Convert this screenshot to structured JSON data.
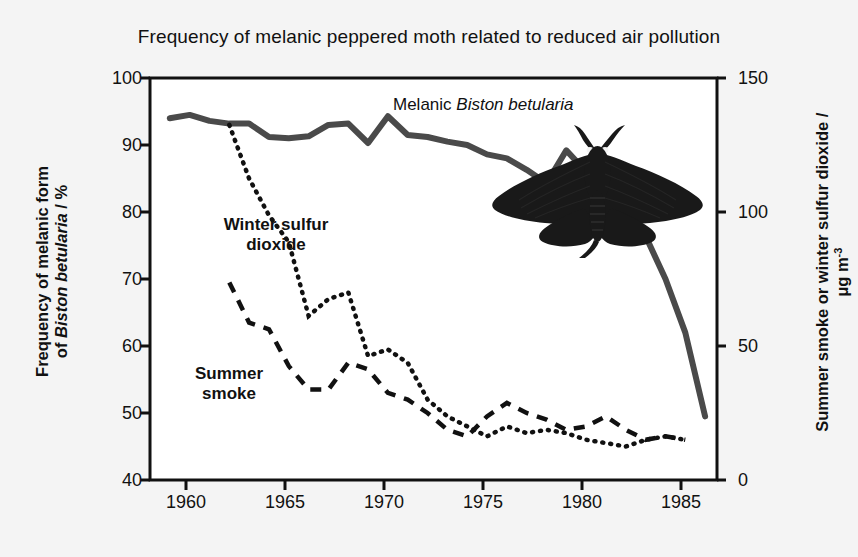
{
  "figure": {
    "title": "Frequency of melanic peppered moth related to reduced air pollution",
    "background_color": "#f4f4f4",
    "plot_background_color": "#ffffff",
    "axis_color": "#111111"
  },
  "annotations": {
    "melanic_label_prefix": "Melanic ",
    "melanic_label_species": "Biston betularia",
    "winter_so2_line1": "Winter sulfur",
    "winter_so2_line2": "dioxide",
    "summer_smoke_line1": "Summer",
    "summer_smoke_line2": "smoke",
    "moth_image_alt": "melanic-peppered-moth-photograph"
  },
  "axes": {
    "left": {
      "label_line1": "Frequency of melanic form",
      "label_line2_prefix": "of ",
      "label_line2_species": "Biston betularia",
      "label_line2_suffix": " / %",
      "ticks": [
        "40",
        "50",
        "60",
        "70",
        "80",
        "90",
        "100"
      ],
      "min": 40,
      "max": 100
    },
    "right": {
      "label_prefix": "Summer smoke or winter sulfur dioxide / ",
      "label_unit_base": "μg m",
      "label_unit_exp": "-3",
      "ticks": [
        "0",
        "50",
        "100",
        "150"
      ],
      "min": 0,
      "max": 150
    },
    "x": {
      "ticks": [
        "1960",
        "1965",
        "1970",
        "1975",
        "1980",
        "1985"
      ],
      "min": 1958,
      "max": 1986.6
    }
  },
  "chart_data": {
    "type": "line",
    "title": "Frequency of melanic peppered moth related to reduced air pollution",
    "xlabel": "",
    "ylabel": "Frequency of melanic form of Biston betularia / %",
    "ylabel_right": "Summer smoke or winter sulfur dioxide / μg m-3",
    "xlim": [
      1958,
      1986.6
    ],
    "ylim": [
      40,
      100
    ],
    "ylim_right": [
      0,
      150
    ],
    "grid": false,
    "legend": "annotations-inline",
    "series": [
      {
        "name": "Melanic Biston betularia",
        "axis": "left",
        "style": "solid",
        "color": "#4a4a4a",
        "width": 6,
        "x": [
          1959,
          1960,
          1961,
          1962,
          1963,
          1964,
          1965,
          1966,
          1967,
          1968,
          1969,
          1970,
          1971,
          1972,
          1973,
          1974,
          1975,
          1976,
          1977,
          1978,
          1979,
          1980,
          1981,
          1982,
          1983,
          1984,
          1985,
          1986
        ],
        "y": [
          94.0,
          94.5,
          93.6,
          93.2,
          93.2,
          91.2,
          91.0,
          91.3,
          93.0,
          93.2,
          90.3,
          94.3,
          91.5,
          91.2,
          90.5,
          90.0,
          88.6,
          88.0,
          86.3,
          84.3,
          89.2,
          86.0,
          80.0,
          76.8,
          76.4,
          70.0,
          62.0,
          49.5
        ]
      },
      {
        "name": "Winter sulfur dioxide",
        "axis": "right",
        "style": "dotted",
        "color": "#111111",
        "width": 4,
        "x": [
          1962,
          1963,
          1964,
          1965,
          1966,
          1967,
          1968,
          1969,
          1970,
          1971,
          1972,
          1973,
          1974,
          1975,
          1976,
          1977,
          1978,
          1979,
          1980,
          1981,
          1982,
          1983,
          1984,
          1985
        ],
        "y_left_equiv": [
          93.0,
          85.0,
          79.5,
          75.5,
          64.5,
          67.0,
          68.0,
          58.5,
          59.5,
          57.5,
          52.0,
          49.5,
          48.0,
          46.5,
          48.0,
          47.0,
          47.5,
          47.0,
          46.0,
          45.5,
          45.0,
          46.0,
          46.5,
          46.0
        ],
        "y": [
          132.5,
          112.5,
          98.8,
          88.8,
          61.3,
          67.5,
          70.0,
          46.3,
          48.8,
          43.8,
          30.0,
          23.8,
          20.0,
          16.3,
          20.0,
          17.5,
          18.8,
          17.5,
          15.0,
          13.8,
          12.5,
          15.0,
          16.3,
          15.0
        ]
      },
      {
        "name": "Summer smoke",
        "axis": "right",
        "style": "dashed",
        "color": "#111111",
        "width": 4,
        "x": [
          1962,
          1963,
          1964,
          1965,
          1966,
          1967,
          1968,
          1969,
          1970,
          1971,
          1972,
          1973,
          1974,
          1975,
          1976,
          1977,
          1978,
          1979,
          1980,
          1981,
          1982,
          1983,
          1984,
          1985
        ],
        "y_left_equiv": [
          69.5,
          63.5,
          62.5,
          57.0,
          53.5,
          53.5,
          57.5,
          56.5,
          53.0,
          52.0,
          50.0,
          47.5,
          46.5,
          49.5,
          51.5,
          50.0,
          49.0,
          47.5,
          48.0,
          49.5,
          47.5,
          46.0,
          46.5,
          46.0
        ],
        "y": [
          73.8,
          58.8,
          56.3,
          42.5,
          33.8,
          33.8,
          43.8,
          41.3,
          32.5,
          30.0,
          25.0,
          18.8,
          16.3,
          23.8,
          28.8,
          25.0,
          22.5,
          18.8,
          20.0,
          23.8,
          18.8,
          15.0,
          16.3,
          15.0
        ]
      }
    ]
  }
}
